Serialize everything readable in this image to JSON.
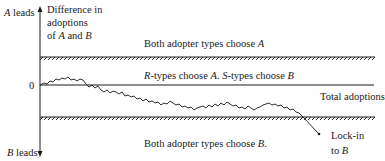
{
  "axis": {
    "title_line1": "Difference in",
    "title_line2": "adoptions",
    "title_line3_pre": "of ",
    "title_line3_a": "A",
    "title_line3_mid": " and ",
    "title_line3_b": "B",
    "top_label_var": "A",
    "top_label_text": " leads",
    "bottom_label_var": "B",
    "bottom_label_text": " leads",
    "zero_label": "0"
  },
  "regions": {
    "top": {
      "pre": "Both adopter types choose ",
      "var": "A",
      "post": ""
    },
    "middle": {
      "r": "R",
      "part1": "-types choose ",
      "a": "A",
      "sep": ". ",
      "s": "S",
      "part2": "-types choose ",
      "b": "B"
    },
    "bottom": {
      "pre": "Both adopter types choose ",
      "var": "B",
      "post": "."
    }
  },
  "x_axis_label": "Total adoptions",
  "annotation": {
    "line1": "Lock-in",
    "line2_pre": "to ",
    "line2_var": "B"
  },
  "colors": {
    "ink": "#1a1a1a",
    "background": "#ffffff"
  }
}
